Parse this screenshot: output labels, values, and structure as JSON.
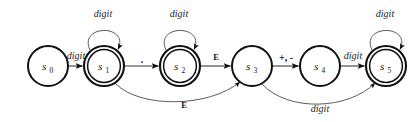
{
  "figure": {
    "kind": "finite-state-automaton",
    "width": 417,
    "height": 122,
    "background_color": "#ffffff",
    "stroke_color": "#111111",
    "edge_color": "#3a3a3a"
  },
  "states": [
    {
      "id": "s0",
      "name": "s",
      "subscript": "0",
      "accepting": false,
      "cx": 48,
      "cy": 66,
      "r": 20
    },
    {
      "id": "s1",
      "name": "s",
      "subscript": "1",
      "accepting": true,
      "cx": 104,
      "cy": 66,
      "r": 20
    },
    {
      "id": "s2",
      "name": "s",
      "subscript": "2",
      "accepting": true,
      "cx": 180,
      "cy": 66,
      "r": 20
    },
    {
      "id": "s3",
      "name": "s",
      "subscript": "3",
      "accepting": false,
      "cx": 252,
      "cy": 66,
      "r": 20
    },
    {
      "id": "s4",
      "name": "s",
      "subscript": "4",
      "accepting": false,
      "cx": 320,
      "cy": 66,
      "r": 20
    },
    {
      "id": "s5",
      "name": "s",
      "subscript": "5",
      "accepting": true,
      "cx": 386,
      "cy": 66,
      "r": 20
    }
  ],
  "transitions": [
    {
      "id": "t0",
      "from": "s0",
      "to": "s1",
      "label": "digit",
      "style": "italic",
      "shape": "straight",
      "label_x": 76,
      "label_y": 59
    },
    {
      "id": "t1",
      "from": "s1",
      "to": "s1",
      "label": "digit",
      "style": "italic",
      "shape": "self-loop",
      "label_x": 103,
      "label_y": 17
    },
    {
      "id": "t2",
      "from": "s1",
      "to": "s2",
      "label": ".",
      "style": "symbol",
      "shape": "straight",
      "label_x": 142,
      "label_y": 62
    },
    {
      "id": "t3",
      "from": "s2",
      "to": "s2",
      "label": "digit",
      "style": "italic",
      "shape": "self-loop",
      "label_x": 179,
      "label_y": 17
    },
    {
      "id": "t4",
      "from": "s2",
      "to": "s3",
      "label": "E",
      "style": "bold",
      "shape": "straight",
      "label_x": 216,
      "label_y": 59
    },
    {
      "id": "t5",
      "from": "s1",
      "to": "s3",
      "label": "E",
      "style": "bold",
      "shape": "curve-below",
      "label_x": 184,
      "label_y": 107
    },
    {
      "id": "t6",
      "from": "s3",
      "to": "s4",
      "label": "+, -",
      "style": "symbol",
      "shape": "straight",
      "label_x": 286,
      "label_y": 60
    },
    {
      "id": "t7",
      "from": "s4",
      "to": "s5",
      "label": "digit",
      "style": "italic",
      "shape": "straight",
      "label_x": 353,
      "label_y": 59
    },
    {
      "id": "t8",
      "from": "s5",
      "to": "s5",
      "label": "digit",
      "style": "italic",
      "shape": "self-loop",
      "label_x": 385,
      "label_y": 17
    },
    {
      "id": "t9",
      "from": "s3",
      "to": "s5",
      "label": "digit",
      "style": "italic",
      "shape": "curve-below",
      "label_x": 320,
      "label_y": 110
    }
  ]
}
